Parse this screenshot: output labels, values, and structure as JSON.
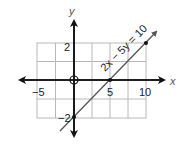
{
  "diagram": {
    "equation_label": "2x − 5y = 10",
    "axes": {
      "x_label": "x",
      "y_label": "y"
    },
    "tick_labels": {
      "x_neg5": "−5",
      "x_5": "5",
      "x_10": "10",
      "y_2": "2",
      "y_neg2": "−2"
    },
    "grid": {
      "x_range": [
        -5,
        10
      ],
      "y_range": [
        -2,
        2
      ],
      "x_step": 2.5,
      "y_step": 1
    },
    "points": [
      {
        "x": 0,
        "y": -2
      },
      {
        "x": 5,
        "y": 0
      },
      {
        "x": 10,
        "y": 2
      }
    ],
    "origin_marker": "open-circle",
    "colors": {
      "grid": "#b8b8b8",
      "axis": "#111111",
      "line": "#555555",
      "point": "#111111"
    }
  }
}
